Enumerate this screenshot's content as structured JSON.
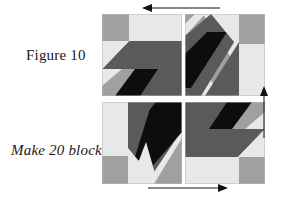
{
  "figure": {
    "caption": "Figure 10",
    "instruction": "Make 20 blocks"
  },
  "colors": {
    "background": "#ffffff",
    "light": "#e8e8e8",
    "medium": "#a0a0a0",
    "dark": "#5a5a5a",
    "black": "#0d0d0d",
    "outline": "#b8b8b8",
    "text": "#1a1a1a",
    "arrow": "#111111"
  },
  "arrows": [
    {
      "name": "top-arrow",
      "direction": "left",
      "glyph": "←"
    },
    {
      "name": "right-arrow",
      "direction": "up",
      "glyph": "↑"
    },
    {
      "name": "bottom-arrow",
      "direction": "right",
      "glyph": "→"
    }
  ],
  "assembly": {
    "rows": 2,
    "columns": 2,
    "blocks": [
      {
        "position": "top-left",
        "rotation_deg": 0,
        "name": "quilt-block-top-left"
      },
      {
        "position": "top-right",
        "rotation_deg": 90,
        "name": "quilt-block-top-right"
      },
      {
        "position": "bottom-left",
        "rotation_deg": 270,
        "name": "quilt-block-bottom-left"
      },
      {
        "position": "bottom-right",
        "rotation_deg": 180,
        "name": "quilt-block-bottom-right"
      }
    ]
  }
}
